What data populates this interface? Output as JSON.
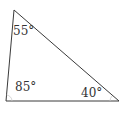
{
  "diagram": {
    "type": "triangle",
    "stroke_color": "#3a3a3a",
    "vertices": {
      "top": [
        14,
        10
      ],
      "bottom_left": [
        6,
        101
      ],
      "bottom_right": [
        119,
        101
      ]
    },
    "angles": [
      {
        "vertex": "top",
        "label": "55°",
        "value": 55
      },
      {
        "vertex": "bottom_left",
        "label": "85°",
        "value": 85
      },
      {
        "vertex": "bottom_right",
        "label": "40°",
        "value": 40
      }
    ]
  }
}
